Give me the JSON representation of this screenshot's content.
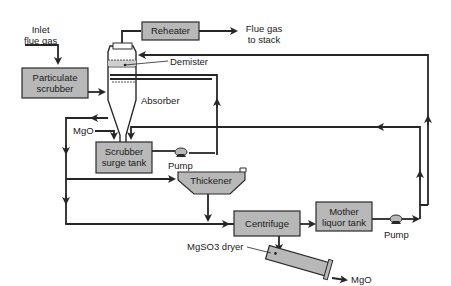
{
  "diagram": {
    "type": "process-flow",
    "labels": {
      "inlet_line1": "Inlet",
      "inlet_line2": "flue gas",
      "reheater": "Reheater",
      "flue_gas_line1": "Flue gas",
      "flue_gas_line2": "to stack",
      "particulate_line1": "Particulate",
      "particulate_line2": "scrubber",
      "demister": "Demister",
      "absorber": "Absorber",
      "mgo_in": "MgO",
      "surge_line1": "Scrubber",
      "surge_line2": "surge tank",
      "pump1": "Pump",
      "thickener": "Thickener",
      "centrifuge": "Centrifuge",
      "mother_line1": "Mother",
      "mother_line2": "liquor tank",
      "pump2": "Pump",
      "dryer": "MgSO3 dryer",
      "mgo_out": "MgO"
    },
    "colors": {
      "box_fill": "#b8b8b8",
      "line": "#262626",
      "background": "#ffffff"
    }
  }
}
